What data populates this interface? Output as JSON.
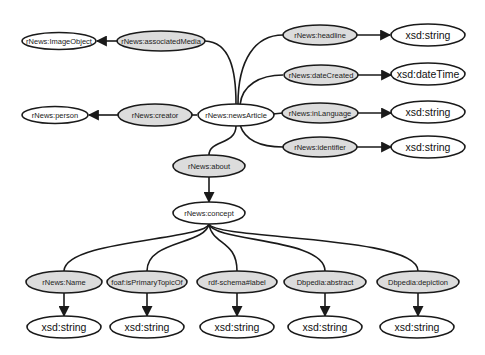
{
  "diagram": {
    "type": "rdf-schema-graph",
    "colors": {
      "property_fill": "#dcdcdc",
      "class_fill": "#ffffff",
      "stroke": "#1a1a1a",
      "background": "#ffffff"
    },
    "nodes": {
      "image_object": "rNews:ImageObject",
      "associated_media": "rNews:associatedMedia",
      "person": "rNews:person",
      "creator": "rNews:creator",
      "news_article": "rNews:newsArticle",
      "headline": "rNews:headline",
      "headline_type": "xsd:string",
      "date_created": "rNews:dateCreated",
      "date_created_type": "xsd:dateTime",
      "in_language": "rNews:inLanguage",
      "in_language_type": "xsd:string",
      "identifier": "rNews:identifier",
      "identifier_type": "xsd:string",
      "about": "rNews:about",
      "concept": "rNews:concept",
      "name": "rNews:Name",
      "name_type": "xsd:string",
      "primary_topic": "foaf:isPrimaryTopicOf",
      "primary_topic_type": "xsd:string",
      "label": "rdf-schema#label",
      "label_type": "xsd:string",
      "abstract": "Dbpedia:abstract",
      "abstract_type": "xsd:string",
      "depiction": "Dbpedia:depiction",
      "depiction_type": "xsd:string"
    },
    "edges": [
      {
        "from": "rNews:newsArticle",
        "to": "rNews:associatedMedia"
      },
      {
        "from": "rNews:associatedMedia",
        "to": "rNews:ImageObject"
      },
      {
        "from": "rNews:newsArticle",
        "to": "rNews:creator"
      },
      {
        "from": "rNews:creator",
        "to": "rNews:person"
      },
      {
        "from": "rNews:newsArticle",
        "to": "rNews:headline"
      },
      {
        "from": "rNews:headline",
        "to": "xsd:string"
      },
      {
        "from": "rNews:newsArticle",
        "to": "rNews:dateCreated"
      },
      {
        "from": "rNews:dateCreated",
        "to": "xsd:dateTime"
      },
      {
        "from": "rNews:newsArticle",
        "to": "rNews:inLanguage"
      },
      {
        "from": "rNews:inLanguage",
        "to": "xsd:string"
      },
      {
        "from": "rNews:newsArticle",
        "to": "rNews:identifier"
      },
      {
        "from": "rNews:identifier",
        "to": "xsd:string"
      },
      {
        "from": "rNews:newsArticle",
        "to": "rNews:about"
      },
      {
        "from": "rNews:about",
        "to": "rNews:concept"
      },
      {
        "from": "rNews:concept",
        "to": "rNews:Name"
      },
      {
        "from": "rNews:Name",
        "to": "xsd:string"
      },
      {
        "from": "rNews:concept",
        "to": "foaf:isPrimaryTopicOf"
      },
      {
        "from": "foaf:isPrimaryTopicOf",
        "to": "xsd:string"
      },
      {
        "from": "rNews:concept",
        "to": "rdf-schema#label"
      },
      {
        "from": "rdf-schema#label",
        "to": "xsd:string"
      },
      {
        "from": "rNews:concept",
        "to": "Dbpedia:abstract"
      },
      {
        "from": "Dbpedia:abstract",
        "to": "xsd:string"
      },
      {
        "from": "rNews:concept",
        "to": "Dbpedia:depiction"
      },
      {
        "from": "Dbpedia:depiction",
        "to": "xsd:string"
      }
    ]
  }
}
